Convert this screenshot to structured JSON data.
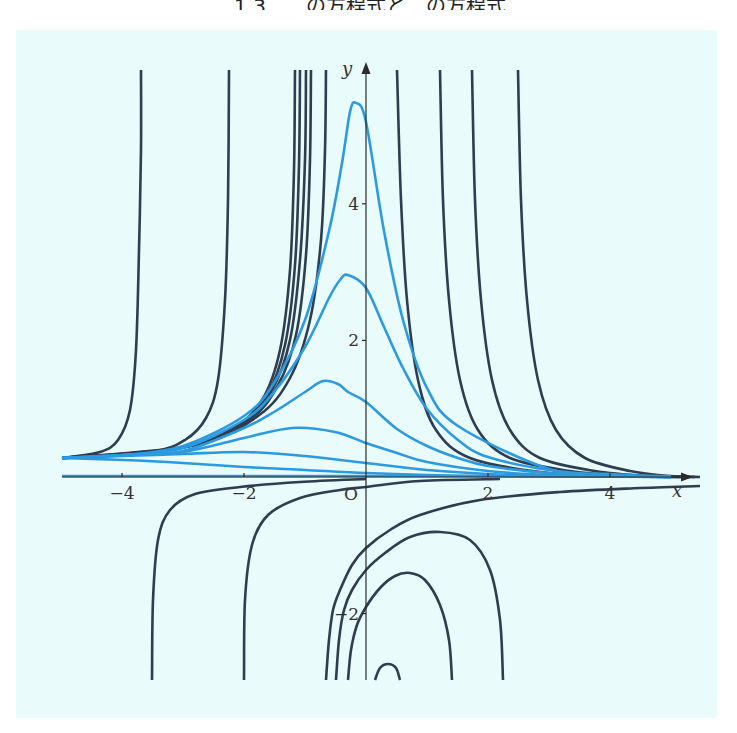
{
  "header": {
    "text": "1.3　…の方程式と…の方程式"
  },
  "colors": {
    "background": "#e9fbfb",
    "dark_curve": "#2e3d4f",
    "blue_curve": "#2b9ae0",
    "axis": "#2a2a2a"
  },
  "axes": {
    "x_label": "x",
    "y_label": "y",
    "origin_label": "O",
    "x_ticks": [
      {
        "value": -4,
        "label": "−4"
      },
      {
        "value": -2,
        "label": "−2"
      },
      {
        "value": 2,
        "label": "2"
      },
      {
        "value": 4,
        "label": "4"
      }
    ],
    "y_ticks": [
      {
        "value": 4,
        "label": "4"
      },
      {
        "value": 2,
        "label": "2"
      },
      {
        "value": -2,
        "label": "−2"
      }
    ]
  },
  "chart_data": {
    "type": "line",
    "title": "",
    "xlabel": "x",
    "ylabel": "y",
    "xlim": [
      -5,
      5.3
    ],
    "ylim": [
      -3,
      5.9
    ],
    "grid": false,
    "legend": null,
    "annotations": [
      "O"
    ],
    "series": [
      {
        "name": "blue-1",
        "color": "blue",
        "x": [
          -5,
          -4,
          -3,
          -2,
          -1.5,
          -1,
          -0.6,
          -0.4,
          -0.2,
          0,
          0.3,
          0.6,
          1,
          1.5,
          2,
          3,
          4,
          5
        ],
        "y": [
          0.28,
          0.34,
          0.5,
          0.9,
          1.4,
          2.3,
          3.6,
          4.6,
          5.45,
          5.2,
          3.6,
          2.3,
          1.3,
          0.7,
          0.38,
          0.12,
          0.04,
          0.0
        ]
      },
      {
        "name": "blue-2",
        "color": "blue",
        "x": [
          -5,
          -4,
          -3,
          -2,
          -1.5,
          -1,
          -0.6,
          -0.3,
          0,
          0.3,
          0.6,
          1,
          1.5,
          2,
          3,
          4,
          5
        ],
        "y": [
          0.28,
          0.34,
          0.5,
          0.85,
          1.25,
          1.9,
          2.6,
          2.9,
          2.75,
          2.2,
          1.6,
          1.0,
          0.55,
          0.3,
          0.1,
          0.03,
          0.0
        ]
      },
      {
        "name": "blue-3",
        "color": "blue",
        "x": [
          -5,
          -4,
          -3,
          -2,
          -1.5,
          -1,
          -0.7,
          -0.3,
          0,
          0.5,
          1,
          1.5,
          2,
          3,
          4,
          5
        ],
        "y": [
          0.28,
          0.33,
          0.45,
          0.72,
          0.95,
          1.25,
          1.4,
          1.35,
          1.1,
          0.7,
          0.45,
          0.27,
          0.16,
          0.06,
          0.02,
          0.0
        ]
      },
      {
        "name": "blue-4",
        "color": "blue",
        "x": [
          -5,
          -4,
          -3,
          -2,
          -1.2,
          -0.5,
          0,
          0.5,
          1,
          2,
          3,
          4,
          5
        ],
        "y": [
          0.28,
          0.32,
          0.42,
          0.6,
          0.72,
          0.65,
          0.5,
          0.35,
          0.22,
          0.09,
          0.03,
          0.01,
          0.0
        ]
      },
      {
        "name": "blue-5",
        "color": "blue",
        "x": [
          -5,
          -4,
          -3,
          -2,
          -1,
          0,
          1,
          2,
          3,
          4,
          5
        ],
        "y": [
          0.28,
          0.3,
          0.33,
          0.35,
          0.3,
          0.2,
          0.11,
          0.05,
          0.02,
          0.01,
          0.0
        ]
      },
      {
        "name": "blue-6",
        "color": "blue",
        "x": [
          -5,
          -4,
          -3,
          -2,
          -1,
          0,
          1,
          2,
          3,
          5
        ],
        "y": [
          0.28,
          0.25,
          0.2,
          0.15,
          0.1,
          0.06,
          0.03,
          0.015,
          0.005,
          0.0
        ]
      },
      {
        "name": "blue-zero",
        "color": "blue",
        "x": [
          -5,
          5
        ],
        "y": [
          0.0,
          0.0
        ]
      },
      {
        "name": "dark-up-1",
        "color": "dark",
        "x": [
          -5,
          -4.6,
          -4.3,
          -4.1,
          -3.95,
          -3.88
        ],
        "y": [
          0.28,
          0.6,
          1.4,
          3.0,
          5.0,
          5.9
        ]
      },
      {
        "name": "dark-up-2",
        "color": "dark",
        "x": [
          -5,
          -4,
          -3.3,
          -2.7,
          -2.5,
          -2.43
        ],
        "y": [
          0.28,
          0.4,
          0.9,
          2.6,
          4.6,
          5.9
        ]
      }
    ]
  },
  "curves": {
    "blue": [
      [
        [
          62,
          458
        ],
        [
          124,
          455
        ],
        [
          183,
          446
        ],
        [
          244,
          416
        ],
        [
          274,
          383
        ],
        [
          305,
          320
        ],
        [
          329,
          231
        ],
        [
          342,
          163
        ],
        [
          350,
          112
        ],
        [
          356,
          103
        ],
        [
          366,
          122
        ],
        [
          384,
          231
        ],
        [
          403,
          320
        ],
        [
          427,
          388
        ],
        [
          458,
          426
        ],
        [
          549,
          469
        ],
        [
          610,
          474
        ],
        [
          671,
          477
        ]
      ],
      [
        [
          62,
          458
        ],
        [
          124,
          455
        ],
        [
          183,
          448
        ],
        [
          244,
          420
        ],
        [
          274,
          392
        ],
        [
          305,
          347
        ],
        [
          329,
          298
        ],
        [
          340,
          280
        ],
        [
          348,
          275
        ],
        [
          366,
          288
        ],
        [
          384,
          327
        ],
        [
          403,
          368
        ],
        [
          427,
          409
        ],
        [
          458,
          440
        ],
        [
          488,
          457
        ],
        [
          549,
          470
        ],
        [
          610,
          475
        ],
        [
          671,
          477
        ]
      ],
      [
        [
          62,
          458
        ],
        [
          124,
          455
        ],
        [
          183,
          451
        ],
        [
          244,
          428
        ],
        [
          274,
          412
        ],
        [
          305,
          392
        ],
        [
          323,
          381
        ],
        [
          338,
          384
        ],
        [
          348,
          392
        ],
        [
          366,
          402
        ],
        [
          397,
          429
        ],
        [
          427,
          446
        ],
        [
          458,
          458
        ],
        [
          488,
          466
        ],
        [
          549,
          473
        ],
        [
          610,
          476
        ],
        [
          671,
          477
        ]
      ],
      [
        [
          62,
          458
        ],
        [
          124,
          455
        ],
        [
          183,
          452
        ],
        [
          244,
          438
        ],
        [
          292,
          428
        ],
        [
          335,
          432
        ],
        [
          366,
          443
        ],
        [
          397,
          453
        ],
        [
          427,
          462
        ],
        [
          488,
          471
        ],
        [
          549,
          475
        ],
        [
          610,
          476
        ],
        [
          671,
          477
        ]
      ],
      [
        [
          62,
          458
        ],
        [
          124,
          456
        ],
        [
          183,
          454
        ],
        [
          244,
          452
        ],
        [
          305,
          456
        ],
        [
          366,
          463
        ],
        [
          427,
          470
        ],
        [
          488,
          474
        ],
        [
          549,
          476
        ],
        [
          671,
          477
        ]
      ],
      [
        [
          62,
          458
        ],
        [
          124,
          460
        ],
        [
          183,
          463
        ],
        [
          244,
          467
        ],
        [
          305,
          470
        ],
        [
          366,
          473
        ],
        [
          427,
          475
        ],
        [
          488,
          476
        ],
        [
          671,
          477
        ]
      ],
      [
        [
          62,
          476
        ],
        [
          671,
          476
        ]
      ]
    ],
    "dark": [
      [
        [
          62,
          458
        ],
        [
          100,
          452
        ],
        [
          118,
          440
        ],
        [
          130,
          410
        ],
        [
          136,
          350
        ],
        [
          139,
          250
        ],
        [
          141,
          150
        ],
        [
          141,
          70
        ]
      ],
      [
        [
          62,
          458
        ],
        [
          150,
          452
        ],
        [
          185,
          440
        ],
        [
          206,
          418
        ],
        [
          218,
          380
        ],
        [
          225,
          300
        ],
        [
          228,
          200
        ],
        [
          229,
          70
        ]
      ],
      [
        [
          62,
          458
        ],
        [
          170,
          450
        ],
        [
          230,
          430
        ],
        [
          262,
          400
        ],
        [
          280,
          350
        ],
        [
          290,
          270
        ],
        [
          294,
          170
        ],
        [
          295,
          70
        ]
      ],
      [
        [
          62,
          458
        ],
        [
          175,
          449
        ],
        [
          236,
          427
        ],
        [
          267,
          395
        ],
        [
          285,
          345
        ],
        [
          295,
          265
        ],
        [
          299,
          165
        ],
        [
          300,
          70
        ]
      ],
      [
        [
          62,
          458
        ],
        [
          180,
          448
        ],
        [
          242,
          424
        ],
        [
          272,
          390
        ],
        [
          290,
          340
        ],
        [
          300,
          260
        ],
        [
          305,
          160
        ],
        [
          306,
          70
        ]
      ],
      [
        [
          62,
          458
        ],
        [
          185,
          447
        ],
        [
          248,
          421
        ],
        [
          278,
          385
        ],
        [
          296,
          335
        ],
        [
          306,
          255
        ],
        [
          310,
          160
        ],
        [
          311,
          70
        ]
      ],
      [
        [
          62,
          458
        ],
        [
          195,
          445
        ],
        [
          258,
          416
        ],
        [
          290,
          378
        ],
        [
          310,
          320
        ],
        [
          321,
          240
        ],
        [
          325,
          150
        ],
        [
          326,
          70
        ]
      ],
      [
        [
          397,
          70
        ],
        [
          401,
          200
        ],
        [
          407,
          300
        ],
        [
          418,
          380
        ],
        [
          436,
          430
        ],
        [
          470,
          458
        ],
        [
          540,
          472
        ],
        [
          610,
          476
        ],
        [
          680,
          477
        ]
      ],
      [
        [
          440,
          70
        ],
        [
          443,
          200
        ],
        [
          449,
          300
        ],
        [
          460,
          380
        ],
        [
          478,
          430
        ],
        [
          510,
          458
        ],
        [
          570,
          471
        ],
        [
          630,
          476
        ],
        [
          690,
          477
        ]
      ],
      [
        [
          472,
          70
        ],
        [
          475,
          200
        ],
        [
          481,
          300
        ],
        [
          492,
          380
        ],
        [
          510,
          430
        ],
        [
          540,
          458
        ],
        [
          595,
          471
        ],
        [
          650,
          476
        ],
        [
          695,
          477
        ]
      ],
      [
        [
          518,
          70
        ],
        [
          521,
          200
        ],
        [
          527,
          300
        ],
        [
          538,
          380
        ],
        [
          556,
          430
        ],
        [
          585,
          458
        ],
        [
          630,
          471
        ],
        [
          670,
          476
        ],
        [
          700,
          477
        ]
      ],
      [
        [
          152,
          680
        ],
        [
          153,
          600
        ],
        [
          158,
          540
        ],
        [
          170,
          510
        ],
        [
          195,
          494
        ],
        [
          240,
          487
        ],
        [
          300,
          482
        ],
        [
          366,
          479
        ]
      ],
      [
        [
          244,
          680
        ],
        [
          245,
          600
        ],
        [
          252,
          545
        ],
        [
          268,
          515
        ],
        [
          300,
          498
        ],
        [
          340,
          490
        ],
        [
          366,
          487
        ],
        [
          420,
          481
        ],
        [
          500,
          479
        ]
      ],
      [
        [
          326,
          680
        ],
        [
          329,
          640
        ],
        [
          333,
          610
        ],
        [
          340,
          590
        ],
        [
          352,
          565
        ],
        [
          366,
          548
        ],
        [
          390,
          530
        ],
        [
          420,
          515
        ],
        [
          480,
          500
        ],
        [
          560,
          492
        ],
        [
          640,
          488
        ],
        [
          700,
          486
        ]
      ],
      [
        [
          336,
          680
        ],
        [
          339,
          640
        ],
        [
          344,
          610
        ],
        [
          352,
          590
        ],
        [
          366,
          570
        ],
        [
          385,
          553
        ],
        [
          410,
          537
        ],
        [
          440,
          532
        ],
        [
          470,
          540
        ],
        [
          490,
          570
        ],
        [
          500,
          620
        ],
        [
          503,
          680
        ]
      ],
      [
        [
          348,
          680
        ],
        [
          351,
          650
        ],
        [
          357,
          625
        ],
        [
          366,
          607
        ],
        [
          380,
          588
        ],
        [
          395,
          576
        ],
        [
          410,
          573
        ],
        [
          425,
          580
        ],
        [
          440,
          605
        ],
        [
          449,
          640
        ],
        [
          452,
          680
        ]
      ],
      [
        [
          375,
          680
        ],
        [
          380,
          668
        ],
        [
          388,
          664
        ],
        [
          396,
          668
        ],
        [
          400,
          680
        ]
      ]
    ]
  }
}
